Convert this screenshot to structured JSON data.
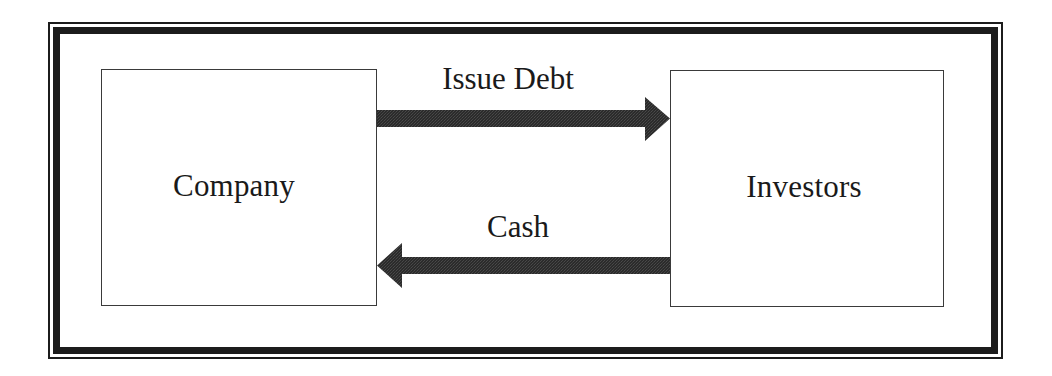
{
  "diagram": {
    "type": "flow",
    "frame": {
      "style": "double-border",
      "color": "#1c1c1c"
    },
    "nodes": [
      {
        "id": "company",
        "label": "Company"
      },
      {
        "id": "investors",
        "label": "Investors"
      }
    ],
    "edges": [
      {
        "from": "company",
        "to": "investors",
        "label": "Issue Debt",
        "color": "#2a2a2a"
      },
      {
        "from": "investors",
        "to": "company",
        "label": "Cash",
        "color": "#2a2a2a"
      }
    ]
  }
}
